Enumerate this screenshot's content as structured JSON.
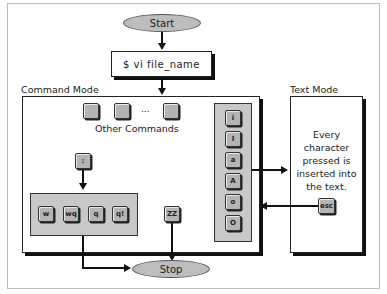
{
  "diagram": {
    "start_label": "Start",
    "command_label": "$ vi file_name",
    "command_mode_title": "Command Mode",
    "text_mode_title": "Text Mode",
    "other_commands_label": "Other Commands",
    "ellipsis": "...",
    "colon_key": ":",
    "exit_keys": [
      "w",
      "wq",
      "q",
      "q!"
    ],
    "zz_key": "ZZ",
    "insert_keys": [
      "i",
      "I",
      "a",
      "A",
      "o",
      "O"
    ],
    "text_mode_description": "Every character pressed is inserted into the text.",
    "esc_key": "esc",
    "stop_label": "Stop"
  }
}
